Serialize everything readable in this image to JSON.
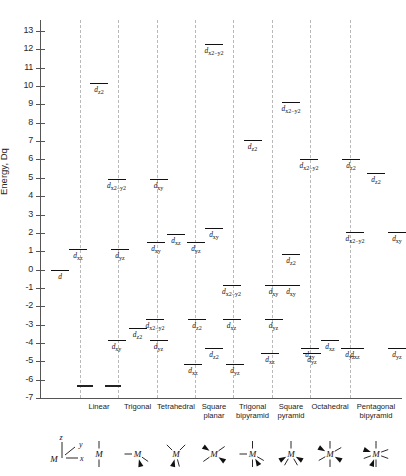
{
  "axis": {
    "label": "Energy, Dq",
    "ticks": [
      13,
      12,
      11,
      10,
      9,
      8,
      7,
      6,
      5,
      4,
      3,
      2,
      1,
      0,
      -1,
      -2,
      -3,
      -4,
      -5,
      -6,
      -7
    ],
    "ymin": -7,
    "ymax": 13.6
  },
  "chart_data": {
    "type": "line",
    "ylabel": "Energy, Dq",
    "xlabel": "",
    "ylim": [
      -7,
      13.6
    ],
    "grid": false,
    "legend_position": "none",
    "categories": [
      "free ion",
      "Linear",
      "Trigonal",
      "Tetrahedral",
      "Square planar",
      "Trigonal bipyramid",
      "Square pyramid",
      "Octahedral",
      "Pentagonal bipyramid"
    ],
    "columns": [
      {
        "name": "free ion",
        "label": "",
        "geometry_glyph": "axes-key",
        "levels": [
          {
            "orbitals": [
              "d"
            ],
            "energy": 0.0,
            "label": "d"
          }
        ]
      },
      {
        "name": "Linear",
        "label": "Linear",
        "geometry_glyph": "linear",
        "levels": [
          {
            "orbitals": [
              "dz2"
            ],
            "energy": 10.14,
            "label": "d z2"
          },
          {
            "orbitals": [
              "dxz",
              "dyz"
            ],
            "energy": 1.14,
            "label": "d xz , d yz"
          },
          {
            "orbitals": [
              "dxy",
              "dx2-y2"
            ],
            "energy": -6.28,
            "label": ""
          }
        ]
      },
      {
        "name": "Trigonal",
        "label": "Trigonal",
        "geometry_glyph": "trigonal",
        "levels": [
          {
            "orbitals": [
              "dx2-y2",
              "dxy"
            ],
            "energy": 4.93,
            "label": "d x2-y2 , d xy"
          },
          {
            "orbitals": [
              "dz2"
            ],
            "energy": -3.21,
            "label": "d z2"
          },
          {
            "orbitals": [
              "dxy",
              "dyz"
            ],
            "energy": -3.86,
            "label": "d xy , d yz"
          }
        ]
      },
      {
        "name": "Tetrahedral",
        "label": "Tetrahedral",
        "geometry_glyph": "tetrahedral",
        "levels": [
          {
            "orbitals": [
              "dxy",
              "dxz",
              "dyz"
            ],
            "energy": 1.78,
            "label": "d xy , d xz , d yz"
          },
          {
            "orbitals": [
              "dx2-y2",
              "dz2"
            ],
            "energy": -2.67,
            "label": "d x2-y2 , d z2"
          }
        ]
      },
      {
        "name": "Square planar",
        "label": "Square planar",
        "geometry_glyph": "square-planar",
        "levels": [
          {
            "orbitals": [
              "dx2-y2"
            ],
            "energy": 12.28,
            "label": "d x2-y2"
          },
          {
            "orbitals": [
              "dxy"
            ],
            "energy": 2.28,
            "label": "d xy"
          },
          {
            "orbitals": [
              "dz2"
            ],
            "energy": -4.28,
            "label": "d z2"
          },
          {
            "orbitals": [
              "dxz",
              "dyz"
            ],
            "energy": -5.14,
            "label": "d xz , d yz"
          }
        ]
      },
      {
        "name": "Trigonal bipyramid",
        "label": "Trigonal bipyramid",
        "geometry_glyph": "trigonal-bipyramid",
        "levels": [
          {
            "orbitals": [
              "dz2"
            ],
            "energy": 7.07,
            "label": "d z2"
          },
          {
            "orbitals": [
              "dx2-y2",
              "dxy"
            ],
            "energy": -0.82,
            "label": "d x2-y2 , d xy"
          },
          {
            "orbitals": [
              "dxz",
              "dyz"
            ],
            "energy": -2.72,
            "label": "d xz , d yz"
          }
        ]
      },
      {
        "name": "Square pyramid",
        "label": "Square pyramid",
        "geometry_glyph": "square-pyramid",
        "levels": [
          {
            "orbitals": [
              "dx2-y2"
            ],
            "energy": 9.14,
            "label": "d x2-y2"
          },
          {
            "orbitals": [
              "dz2"
            ],
            "energy": 0.86,
            "label": "d z2"
          },
          {
            "orbitals": [
              "dxy"
            ],
            "energy": -0.86,
            "label": "d xy"
          },
          {
            "orbitals": [
              "dxz",
              "dyz"
            ],
            "energy": -4.57,
            "label": "d xz , d yz"
          }
        ]
      },
      {
        "name": "Octahedral",
        "label": "Octahedral",
        "geometry_glyph": "octahedral",
        "levels": [
          {
            "orbitals": [
              "dx2-y2",
              "dz2"
            ],
            "energy": 6.0,
            "label": "d x2-y2 , d z2"
          },
          {
            "orbitals": [
              "dxy",
              "dxz",
              "dyz"
            ],
            "energy": -4.0,
            "label": "d xy , d xz , d yz"
          }
        ]
      },
      {
        "name": "Pentagonal bipyramid",
        "label": "Pentagonal bipyramid",
        "geometry_glyph": "pentagonal-bipyramid",
        "levels": [
          {
            "orbitals": [
              "dz2"
            ],
            "energy": 5.28,
            "label": "d z2"
          },
          {
            "orbitals": [
              "dx2-y2",
              "dxy"
            ],
            "energy": 2.07,
            "label": "d x2-y2 , d xy"
          },
          {
            "orbitals": [
              "dxz",
              "dyz"
            ],
            "energy": -4.28,
            "label": "d xz , d yz"
          }
        ]
      }
    ]
  },
  "orbital_glyphs": {
    "d": "d",
    "dz2": "d|z2",
    "dxy": "d|xy",
    "dxz": "d|xz",
    "dyz": "d|yz",
    "dx2-y2": "d|x2−y2"
  },
  "key": {
    "center_atom": "M",
    "axis_z": "z",
    "axis_y": "y",
    "axis_x": "x"
  }
}
